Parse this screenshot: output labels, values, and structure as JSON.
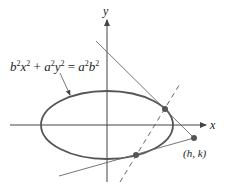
{
  "diagram": {
    "equation_label": {
      "parts": [
        "b",
        "2",
        "x",
        "2",
        " + ",
        "a",
        "2",
        "y",
        "2",
        " = ",
        "a",
        "2",
        "b",
        "2"
      ],
      "text": "b²x² + a²y² = a²b²"
    },
    "axes": {
      "x_label": "x",
      "y_label": "y"
    },
    "external_point_label": "(h, k)",
    "colors": {
      "ellipse": "#555555",
      "axes": "#444444",
      "lines": "#666666",
      "points": "#555555"
    }
  }
}
